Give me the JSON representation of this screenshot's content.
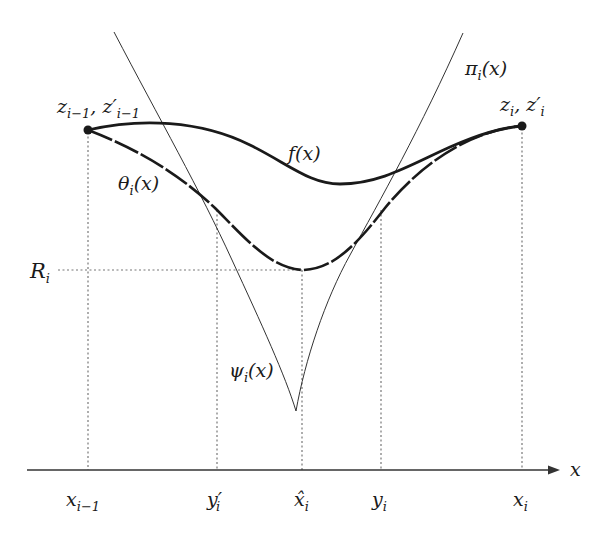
{
  "figure": {
    "colors": {
      "background": "#ffffff",
      "curve_thick": "#1a1a1a",
      "curve_thin": "#333333",
      "guide_dotted": "#777777",
      "axis": "#333333"
    },
    "labels": {
      "f": "f(x)",
      "theta": "θ",
      "theta_sub": "i",
      "theta_arg": "(x)",
      "pi": "π",
      "pi_sub": "i",
      "pi_arg": "(x)",
      "psi": "ψ",
      "psi_sub": "i",
      "psi_arg": "(x)",
      "left_point_main": "z",
      "left_point_sub": "i−1",
      "left_point_sep": ", ",
      "left_point_prime": "z′",
      "left_point_prime_sub": "i−1",
      "right_point_main": "z",
      "right_point_sub": "i",
      "right_point_sep": ", ",
      "right_point_prime": "z′",
      "right_point_prime_sub": "i",
      "R": "R",
      "R_sub": "i",
      "axis_label": "x"
    },
    "axis_ticks": [
      {
        "main": "x",
        "sub": "i−1",
        "x": 88
      },
      {
        "main": "y′",
        "sub": "i",
        "x": 217
      },
      {
        "main": "x̂",
        "sub": "i",
        "x": 302
      },
      {
        "main": "y",
        "sub": "i",
        "x": 381
      },
      {
        "main": "x",
        "sub": "i",
        "x": 522
      }
    ]
  }
}
